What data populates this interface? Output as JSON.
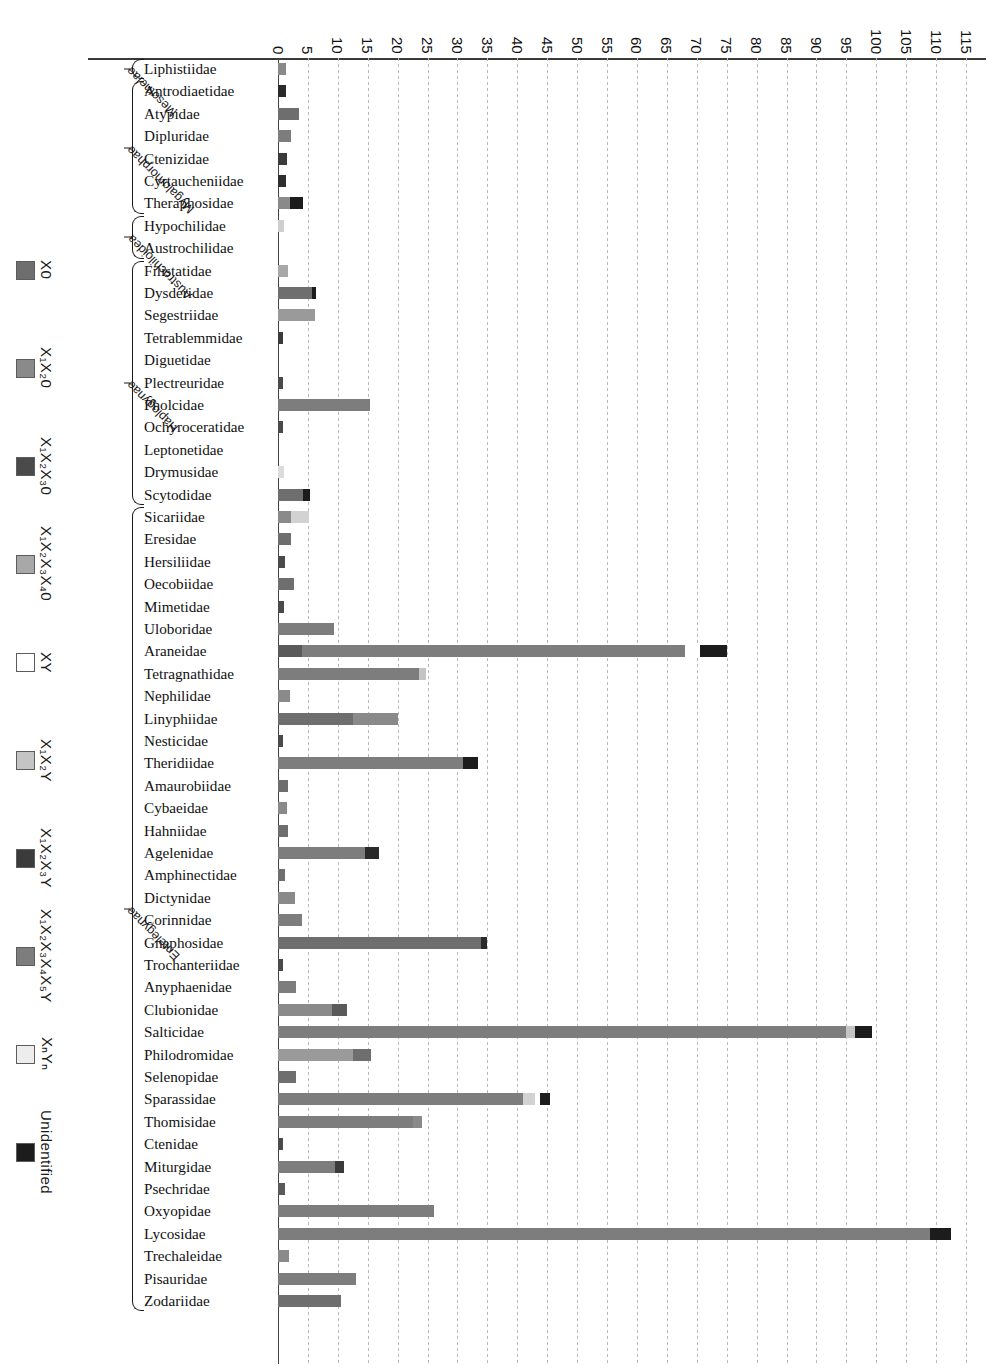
{
  "chart_data": {
    "type": "bar",
    "orientation": "horizontal-stacked",
    "title": "",
    "xlabel": "",
    "ylabel": "",
    "xlim": [
      0,
      117
    ],
    "grid": true,
    "legend_position": "left",
    "ticks": [
      0,
      5,
      10,
      15,
      20,
      25,
      30,
      35,
      40,
      45,
      50,
      55,
      60,
      65,
      70,
      75,
      80,
      85,
      90,
      95,
      100,
      105,
      110,
      115
    ],
    "legend": [
      {
        "label": "X0",
        "sub": "",
        "color": "#6e6e6e"
      },
      {
        "label": "X₁X₂0",
        "sub": "",
        "color": "#8a8a8a"
      },
      {
        "label": "X₁X₂X₃0",
        "sub": "",
        "color": "#4a4a4a"
      },
      {
        "label": "X₁X₂X₃X₄0",
        "sub": "",
        "color": "#a8a8a8"
      },
      {
        "label": "XY",
        "sub": "",
        "color": "#ffffff"
      },
      {
        "label": "X₁X₂Y",
        "sub": "",
        "color": "#c4c4c4"
      },
      {
        "label": "X₁X₂X₃Y",
        "sub": "",
        "color": "#3b3b3b"
      },
      {
        "label": "X₁X₂X₃X₄X₅Y",
        "sub": "",
        "color": "#7d7d7d"
      },
      {
        "label": "XₙYₙ",
        "sub": "",
        "color": "#ededed"
      },
      {
        "label": "Unidentified",
        "sub": "",
        "color": "#1c1c1c"
      }
    ],
    "groups": [
      {
        "name": "Mesothelae",
        "start": 0,
        "end": 0
      },
      {
        "name": "Mygalomorphae",
        "start": 1,
        "end": 6
      },
      {
        "name": "Austrochiloidea",
        "start": 7,
        "end": 8
      },
      {
        "name": "Haplogynae",
        "start": 9,
        "end": 19
      },
      {
        "name": "Entelegynae",
        "start": 20,
        "end": 55
      }
    ],
    "categories": [
      "Liphistiidae",
      "Antrodiaetidae",
      "Atypidae",
      "Dipluridae",
      "Ctenizidae",
      "Cyrtaucheniidae",
      "Theraphosidae",
      "Hypochilidae",
      "Austrochilidae",
      "Filistatidae",
      "Dysderidae",
      "Segestriidae",
      "Tetrablemmidae",
      "Diguetidae",
      "Plectreuridae",
      "Pholcidae",
      "Ochyroceratidae",
      "Leptonetidae",
      "Drymusidae",
      "Scytodidae",
      "Sicariidae",
      "Eresidae",
      "Hersiliidae",
      "Oecobiidae",
      "Mimetidae",
      "Uloboridae",
      "Araneidae",
      "Tetragnathidae",
      "Nephilidae",
      "Linyphiidae",
      "Nesticidae",
      "Theridiidae",
      "Amaurobiidae",
      "Cybaeidae",
      "Hahniidae",
      "Agelenidae",
      "Amphinectidae",
      "Dictynidae",
      "Corinnidae",
      "Gnaphosidae",
      "Trochanteriidae",
      "Anyphaenidae",
      "Clubionidae",
      "Salticidae",
      "Philodromidae",
      "Selenopidae",
      "Sparassidae",
      "Thomisidae",
      "Ctenidae",
      "Miturgidae",
      "Psechridae",
      "Oxyopidae",
      "Lycosidae",
      "Trechaleidae",
      "Pisauridae",
      "Zodariidae"
    ],
    "stacks": [
      [
        {
          "c": "#8a8a8a",
          "v": 1.3
        }
      ],
      [
        {
          "c": "#2a2a2a",
          "v": 1.4
        }
      ],
      [
        {
          "c": "#6e6e6e",
          "v": 3.5
        }
      ],
      [
        {
          "c": "#7d7d7d",
          "v": 2.2
        }
      ],
      [
        {
          "c": "#3b3b3b",
          "v": 1.5
        }
      ],
      [
        {
          "c": "#2e2e2e",
          "v": 1.4
        }
      ],
      [
        {
          "c": "#8a8a8a",
          "v": 2.0
        },
        {
          "c": "#1c1c1c",
          "v": 2.2
        }
      ],
      [
        {
          "c": "#cfcfcf",
          "v": 1.0
        }
      ],
      [],
      [
        {
          "c": "#a8a8a8",
          "v": 1.6
        }
      ],
      [
        {
          "c": "#6e6e6e",
          "v": 5.7
        },
        {
          "c": "#1c1c1c",
          "v": 0.6
        }
      ],
      [
        {
          "c": "#9a9a9a",
          "v": 6.2
        }
      ],
      [
        {
          "c": "#3b3b3b",
          "v": 0.8
        }
      ],
      [],
      [
        {
          "c": "#4a4a4a",
          "v": 0.8
        }
      ],
      [
        {
          "c": "#7d7d7d",
          "v": 15.3
        }
      ],
      [
        {
          "c": "#4a4a4a",
          "v": 0.9
        }
      ],
      [],
      [
        {
          "c": "#dcdcdc",
          "v": 1.0
        }
      ],
      [
        {
          "c": "#6e6e6e",
          "v": 4.2
        },
        {
          "c": "#1c1c1c",
          "v": 1.1
        }
      ],
      [
        {
          "c": "#8a8a8a",
          "v": 2.2
        },
        {
          "c": "#d2d2d2",
          "v": 3.0
        }
      ],
      [
        {
          "c": "#6e6e6e",
          "v": 2.1
        }
      ],
      [
        {
          "c": "#4a4a4a",
          "v": 1.2
        }
      ],
      [
        {
          "c": "#6e6e6e",
          "v": 2.6
        }
      ],
      [
        {
          "c": "#4a4a4a",
          "v": 1.0
        }
      ],
      [
        {
          "c": "#7d7d7d",
          "v": 9.3
        }
      ],
      [
        {
          "c": "#5a5a5a",
          "v": 4.0
        },
        {
          "c": "#7d7d7d",
          "v": 64.0
        },
        {
          "c": "#ffffff",
          "v": 2.5
        },
        {
          "c": "#1c1c1c",
          "v": 4.5
        }
      ],
      [
        {
          "c": "#7d7d7d",
          "v": 23.5
        },
        {
          "c": "#c4c4c4",
          "v": 1.3
        }
      ],
      [
        {
          "c": "#8a8a8a",
          "v": 2.0
        }
      ],
      [
        {
          "c": "#6e6e6e",
          "v": 12.5
        },
        {
          "c": "#8a8a8a",
          "v": 7.5
        }
      ],
      [
        {
          "c": "#4a4a4a",
          "v": 0.9
        }
      ],
      [
        {
          "c": "#7d7d7d",
          "v": 31.0
        },
        {
          "c": "#1c1c1c",
          "v": 2.4
        }
      ],
      [
        {
          "c": "#6e6e6e",
          "v": 1.7
        }
      ],
      [
        {
          "c": "#8a8a8a",
          "v": 1.5
        }
      ],
      [
        {
          "c": "#6e6e6e",
          "v": 1.6
        }
      ],
      [
        {
          "c": "#7d7d7d",
          "v": 14.5
        },
        {
          "c": "#2a2a2a",
          "v": 2.3
        }
      ],
      [
        {
          "c": "#6e6e6e",
          "v": 1.2
        }
      ],
      [
        {
          "c": "#8a8a8a",
          "v": 2.8
        }
      ],
      [
        {
          "c": "#7d7d7d",
          "v": 4.0
        }
      ],
      [
        {
          "c": "#6e6e6e",
          "v": 34.0
        },
        {
          "c": "#2a2a2a",
          "v": 1.0
        }
      ],
      [
        {
          "c": "#4a4a4a",
          "v": 0.8
        }
      ],
      [
        {
          "c": "#7d7d7d",
          "v": 3.0
        }
      ],
      [
        {
          "c": "#8a8a8a",
          "v": 9.0
        },
        {
          "c": "#5a5a5a",
          "v": 2.5
        }
      ],
      [
        {
          "c": "#7d7d7d",
          "v": 95.0
        },
        {
          "c": "#c4c4c4",
          "v": 1.5
        },
        {
          "c": "#1c1c1c",
          "v": 2.8
        }
      ],
      [
        {
          "c": "#9a9a9a",
          "v": 12.5
        },
        {
          "c": "#6e6e6e",
          "v": 3.0
        }
      ],
      [
        {
          "c": "#6e6e6e",
          "v": 3.0
        }
      ],
      [
        {
          "c": "#7d7d7d",
          "v": 41.0
        },
        {
          "c": "#d2d2d2",
          "v": 2.0
        },
        {
          "c": "#ffffff",
          "v": 0.8
        },
        {
          "c": "#1c1c1c",
          "v": 1.6
        }
      ],
      [
        {
          "c": "#7d7d7d",
          "v": 22.5
        },
        {
          "c": "#8a8a8a",
          "v": 1.5
        }
      ],
      [
        {
          "c": "#4a4a4a",
          "v": 0.9
        }
      ],
      [
        {
          "c": "#7d7d7d",
          "v": 9.5
        },
        {
          "c": "#3b3b3b",
          "v": 1.5
        }
      ],
      [
        {
          "c": "#5a5a5a",
          "v": 1.2
        }
      ],
      [
        {
          "c": "#7d7d7d",
          "v": 26.0
        }
      ],
      [
        {
          "c": "#7d7d7d",
          "v": 109.0
        },
        {
          "c": "#1c1c1c",
          "v": 3.5
        }
      ],
      [
        {
          "c": "#8a8a8a",
          "v": 1.9
        }
      ],
      [
        {
          "c": "#7d7d7d",
          "v": 13.0
        }
      ],
      [
        {
          "c": "#6e6e6e",
          "v": 10.5
        }
      ]
    ]
  }
}
